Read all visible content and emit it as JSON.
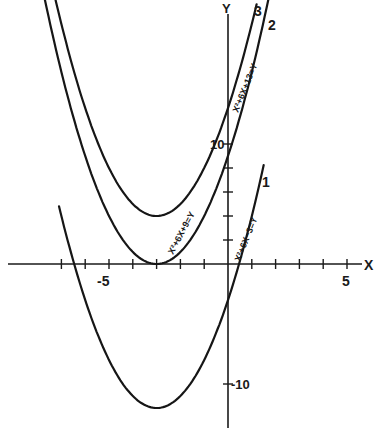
{
  "chart_data": {
    "type": "line",
    "title": "",
    "xlabel": "X",
    "ylabel": "Y",
    "xlim": [
      -9.5,
      6
    ],
    "ylim": [
      -14,
      22
    ],
    "grid": false,
    "x_tick_labels": [
      {
        "value": -5,
        "label": "-5"
      },
      {
        "value": 5,
        "label": "5"
      }
    ],
    "y_tick_labels": [
      {
        "value": 10,
        "label": "10"
      },
      {
        "value": -10,
        "label": "-10"
      }
    ],
    "x_ticks": [
      -7,
      -6,
      -5,
      -4,
      -3,
      -2,
      -1,
      0,
      1,
      2,
      3,
      4,
      5
    ],
    "y_ticks": [
      2,
      4,
      6,
      8,
      10,
      -10
    ],
    "series": [
      {
        "name": "1",
        "equation": "x² + 6x − 3 = y",
        "a": 1,
        "b": 6,
        "c": -3,
        "vertex": [
          -3,
          -12
        ],
        "x_range": [
          -7.1,
          1.5
        ]
      },
      {
        "name": "2",
        "equation": "x² + 6x + 9 = y",
        "a": 1,
        "b": 6,
        "c": 9,
        "vertex": [
          -3,
          0
        ],
        "x_range": [
          -7.7,
          1.7
        ]
      },
      {
        "name": "3",
        "equation": "x² + 6x + 13 = y",
        "a": 1,
        "b": 6,
        "c": 13,
        "vertex": [
          -3,
          4
        ],
        "x_range": [
          -7.3,
          1.2
        ]
      }
    ],
    "legend": "inline curve labels 1, 2, 3"
  },
  "labels": {
    "x_axis": "X",
    "y_axis": "Y",
    "x_neg5": "-5",
    "x_pos5": "5",
    "y_pos10": "10",
    "y_neg10": "-10",
    "curve1_num": "1",
    "curve2_num": "2",
    "curve3_num": "3",
    "curve1_eq": "X²+6X−3=Y",
    "curve2_eq": "X²+6X+9=Y",
    "curve3_eq": "X²+6X+13=Y"
  }
}
